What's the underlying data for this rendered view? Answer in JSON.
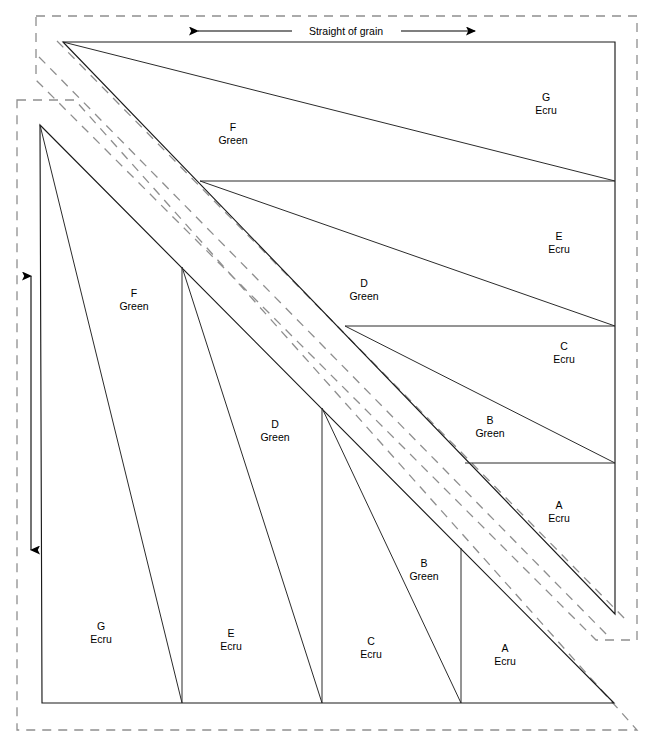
{
  "diagram": {
    "title": "Straight of grain",
    "grain_label": "Straight of grain",
    "fabrics": {
      "green": "Green",
      "ecru": "Ecru"
    },
    "upper_unit": {
      "name": "upper-right-unit",
      "pieces": [
        {
          "id": "G",
          "letter": "G",
          "fabric": "Ecru",
          "x": 546,
          "y": 101
        },
        {
          "id": "F",
          "letter": "F",
          "fabric": "Green",
          "x": 233,
          "y": 131
        },
        {
          "id": "E",
          "letter": "E",
          "fabric": "Ecru",
          "x": 559,
          "y": 240
        },
        {
          "id": "D",
          "letter": "D",
          "fabric": "Green",
          "x": 364,
          "y": 287
        },
        {
          "id": "C",
          "letter": "C",
          "fabric": "Ecru",
          "x": 564,
          "y": 350
        },
        {
          "id": "B",
          "letter": "B",
          "fabric": "Green",
          "x": 490,
          "y": 424
        },
        {
          "id": "A",
          "letter": "A",
          "fabric": "Ecru",
          "x": 559,
          "y": 509
        }
      ]
    },
    "lower_unit": {
      "name": "lower-left-unit",
      "pieces": [
        {
          "id": "F",
          "letter": "F",
          "fabric": "Green",
          "x": 134,
          "y": 297
        },
        {
          "id": "D",
          "letter": "D",
          "fabric": "Green",
          "x": 275,
          "y": 428
        },
        {
          "id": "B",
          "letter": "B",
          "fabric": "Green",
          "x": 424,
          "y": 567
        },
        {
          "id": "G",
          "letter": "G",
          "fabric": "Ecru",
          "x": 101,
          "y": 630
        },
        {
          "id": "E",
          "letter": "E",
          "fabric": "Ecru",
          "x": 231,
          "y": 637
        },
        {
          "id": "C",
          "letter": "C",
          "fabric": "Ecru",
          "x": 371,
          "y": 645
        },
        {
          "id": "A",
          "letter": "A",
          "fabric": "Ecru",
          "x": 505,
          "y": 652
        }
      ]
    },
    "colors": {
      "line": "#1a1a1a",
      "dashed_guide": "#8e8e8e",
      "text": "#000000",
      "background": "#ffffff"
    }
  }
}
